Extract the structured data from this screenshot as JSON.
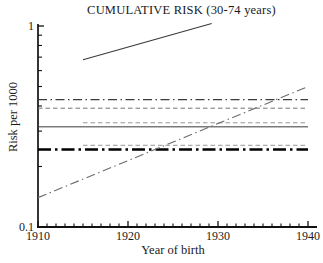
{
  "chart_data": {
    "type": "line",
    "title": "CUMULATIVE RISK (30-74 years)",
    "xlabel": "Year of birth",
    "ylabel": "Risk per 1000",
    "x_scale": "linear",
    "y_scale": "log",
    "xlim": [
      1910,
      1940
    ],
    "ylim": [
      0.1,
      1
    ],
    "x_major_ticks": [
      1910,
      1920,
      1930,
      1940
    ],
    "x_major_tick_labels": [
      "1910",
      "1920",
      "1930",
      "1940"
    ],
    "x_minor_tick_interval": 1,
    "y_major_ticks": [
      1,
      0.1
    ],
    "y_major_tick_labels": [
      "1",
      "0.1"
    ],
    "y_minor_ticks": [
      0.9,
      0.8,
      0.7,
      0.6,
      0.5,
      0.4,
      0.3,
      0.2
    ],
    "grid": false,
    "legend": false,
    "series": [
      {
        "name": "rising-solid-upper",
        "style": "solid",
        "color": "#3a3a3a",
        "width": 1.1,
        "points": [
          [
            1915,
            0.68
          ],
          [
            1929.3,
            1.03
          ]
        ]
      },
      {
        "name": "horizontal-dashdot-0.43",
        "style": "dashdot",
        "color": "#3c3c3c",
        "width": 1.2,
        "points": [
          [
            1910,
            0.43
          ],
          [
            1940,
            0.43
          ]
        ]
      },
      {
        "name": "horizontal-dashed-0.39",
        "style": "dashed",
        "color": "#757575",
        "width": 1.0,
        "points": [
          [
            1910,
            0.39
          ],
          [
            1940,
            0.39
          ]
        ]
      },
      {
        "name": "horizontal-dashed-0.33",
        "style": "dashed",
        "color": "#8a8a8a",
        "width": 0.9,
        "points": [
          [
            1915,
            0.33
          ],
          [
            1940,
            0.33
          ]
        ]
      },
      {
        "name": "horizontal-solid-0.315",
        "style": "solid",
        "color": "#3a3a3a",
        "width": 1.0,
        "points": [
          [
            1910,
            0.315
          ],
          [
            1940,
            0.315
          ]
        ]
      },
      {
        "name": "horizontal-dashed-0.255",
        "style": "dashed",
        "color": "#8a8a8a",
        "width": 0.9,
        "points": [
          [
            1915,
            0.255
          ],
          [
            1940,
            0.255
          ]
        ]
      },
      {
        "name": "horizontal-thick-dashdot-0.243",
        "style": "dashdot-bold",
        "color": "#000000",
        "width": 2.6,
        "points": [
          [
            1910,
            0.243
          ],
          [
            1940,
            0.243
          ]
        ]
      },
      {
        "name": "rising-dashdot-lower",
        "style": "dashdot",
        "color": "#6b6b6b",
        "width": 1.1,
        "points": [
          [
            1910,
            0.14
          ],
          [
            1940,
            0.5
          ]
        ]
      }
    ]
  }
}
